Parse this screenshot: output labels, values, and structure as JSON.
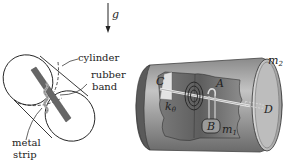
{
  "gravity": {
    "label": "g"
  },
  "left_figure": {
    "labels": {
      "cylinder": "cylinder",
      "rubber_band_line1": "rubber",
      "rubber_band_line2": "band",
      "metal_strip_line1": "metal",
      "metal_strip_line2": "strip"
    }
  },
  "right_figure": {
    "labels": {
      "C": "C",
      "A": "A",
      "D": "D",
      "B": "B",
      "k": "k",
      "k_sub": "θ",
      "m1": "m",
      "m1_sub": "1",
      "m2": "m",
      "m2_sub": "2"
    }
  },
  "colors": {
    "cylinder_dark": "#6e6e6e",
    "cylinder_mid": "#9a9a9a",
    "cylinder_light": "#cfcfcf",
    "strip": "#6a6a6a",
    "line": "#222222"
  }
}
